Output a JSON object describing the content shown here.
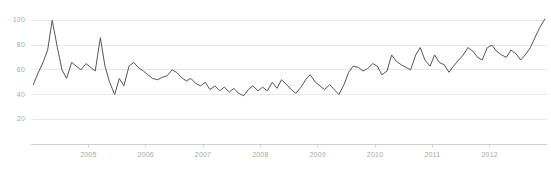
{
  "chart_data": {
    "type": "line",
    "title": "",
    "subtitle": "",
    "xlabel": "",
    "ylabel": "",
    "grid": true,
    "legend_position": "none",
    "ylim": [
      0,
      110
    ],
    "xlim": [
      2004.0,
      2013.0
    ],
    "y_ticks": [
      100,
      80,
      60,
      40,
      20
    ],
    "y_tick_labels": [
      "100",
      "80",
      "60",
      "40",
      "20"
    ],
    "x_ticks": [
      2005,
      2006,
      2007,
      2008,
      2009,
      2010,
      2011,
      2012
    ],
    "x_tick_labels": [
      "2005",
      "2006",
      "2007",
      "2008",
      "2009",
      "2010",
      "2011",
      "2012"
    ],
    "line_color": "#555555",
    "grid_color": "#e9e9e9",
    "axis_color": "#cccccc",
    "tick_text_color": "#a8a8a8",
    "background_color": "#ffffff",
    "series": [
      {
        "name": "Search interest",
        "x": [
          2004.04,
          2004.12,
          2004.21,
          2004.29,
          2004.37,
          2004.46,
          2004.54,
          2004.62,
          2004.71,
          2004.79,
          2004.87,
          2004.96,
          2005.04,
          2005.12,
          2005.21,
          2005.29,
          2005.37,
          2005.46,
          2005.54,
          2005.62,
          2005.71,
          2005.79,
          2005.87,
          2005.96,
          2006.04,
          2006.12,
          2006.21,
          2006.29,
          2006.37,
          2006.46,
          2006.54,
          2006.62,
          2006.71,
          2006.79,
          2006.87,
          2006.96,
          2007.04,
          2007.12,
          2007.21,
          2007.29,
          2007.37,
          2007.46,
          2007.54,
          2007.62,
          2007.71,
          2007.79,
          2007.87,
          2007.96,
          2008.04,
          2008.12,
          2008.21,
          2008.29,
          2008.37,
          2008.46,
          2008.54,
          2008.62,
          2008.71,
          2008.79,
          2008.87,
          2008.96,
          2009.04,
          2009.12,
          2009.21,
          2009.29,
          2009.37,
          2009.46,
          2009.54,
          2009.62,
          2009.71,
          2009.79,
          2009.87,
          2009.96,
          2010.04,
          2010.12,
          2010.21,
          2010.29,
          2010.37,
          2010.46,
          2010.54,
          2010.62,
          2010.71,
          2010.79,
          2010.87,
          2010.96,
          2011.04,
          2011.12,
          2011.21,
          2011.29,
          2011.37,
          2011.46,
          2011.54,
          2011.62,
          2011.71,
          2011.79,
          2011.87,
          2011.96,
          2012.04,
          2012.12,
          2012.21,
          2012.29,
          2012.37,
          2012.46,
          2012.54,
          2012.62,
          2012.71,
          2012.79,
          2012.87,
          2012.96
        ],
        "values": [
          48,
          57,
          66,
          76,
          100,
          78,
          60,
          53,
          66,
          63,
          60,
          65,
          62,
          59,
          86,
          63,
          50,
          40,
          53,
          47,
          63,
          66,
          62,
          59,
          56,
          53,
          52,
          54,
          55,
          60,
          58,
          54,
          51,
          53,
          49,
          47,
          50,
          44,
          47,
          43,
          46,
          42,
          45,
          41,
          39,
          44,
          47,
          43,
          46,
          43,
          50,
          45,
          52,
          48,
          44,
          41,
          46,
          52,
          56,
          50,
          47,
          44,
          48,
          44,
          40,
          48,
          58,
          63,
          62,
          59,
          61,
          65,
          63,
          56,
          59,
          72,
          67,
          64,
          62,
          60,
          72,
          78,
          68,
          63,
          72,
          66,
          64,
          58,
          63,
          68,
          72,
          78,
          75,
          70,
          68,
          78,
          80,
          75,
          72,
          70,
          76,
          73,
          68,
          72,
          78,
          86,
          94,
          101
        ]
      }
    ]
  }
}
